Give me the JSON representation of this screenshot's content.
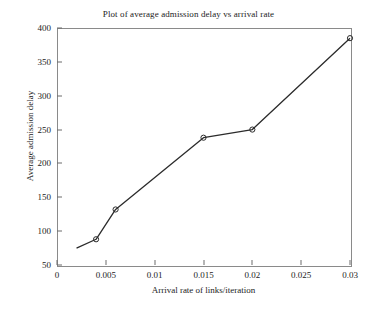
{
  "chart_data": {
    "type": "line",
    "title": "Plot of average admission delay vs arrival rate",
    "xlabel": "Arrival rate of links/iteration",
    "ylabel": "Average admission delay",
    "xlim": [
      0,
      0.03
    ],
    "ylim": [
      50,
      400
    ],
    "xticks": [
      0,
      0.005,
      0.01,
      0.015,
      0.02,
      0.025,
      0.03
    ],
    "xtick_labels": [
      "0",
      "0.005",
      "0.01",
      "0.015",
      "0.02",
      "0.025",
      "0.03"
    ],
    "yticks": [
      50,
      100,
      150,
      200,
      250,
      300,
      350,
      400
    ],
    "ytick_labels": [
      "50",
      "100",
      "150",
      "200",
      "250",
      "300",
      "350",
      "400"
    ],
    "grid": false,
    "legend": null,
    "series": [
      {
        "name": "average admission delay",
        "marker": "circle",
        "line_color": "#2b2b2b",
        "marker_color": "#2b2b2b",
        "x": [
          0.002,
          0.004,
          0.006,
          0.015,
          0.02,
          0.03
        ],
        "y": [
          75,
          88,
          132,
          238,
          250,
          385
        ],
        "markers_shown": [
          false,
          true,
          true,
          true,
          true,
          true
        ]
      }
    ]
  },
  "figure": {
    "background": "#ffffff",
    "frame_color": "#8a8a8a",
    "text_color": "#1c1c1c"
  }
}
